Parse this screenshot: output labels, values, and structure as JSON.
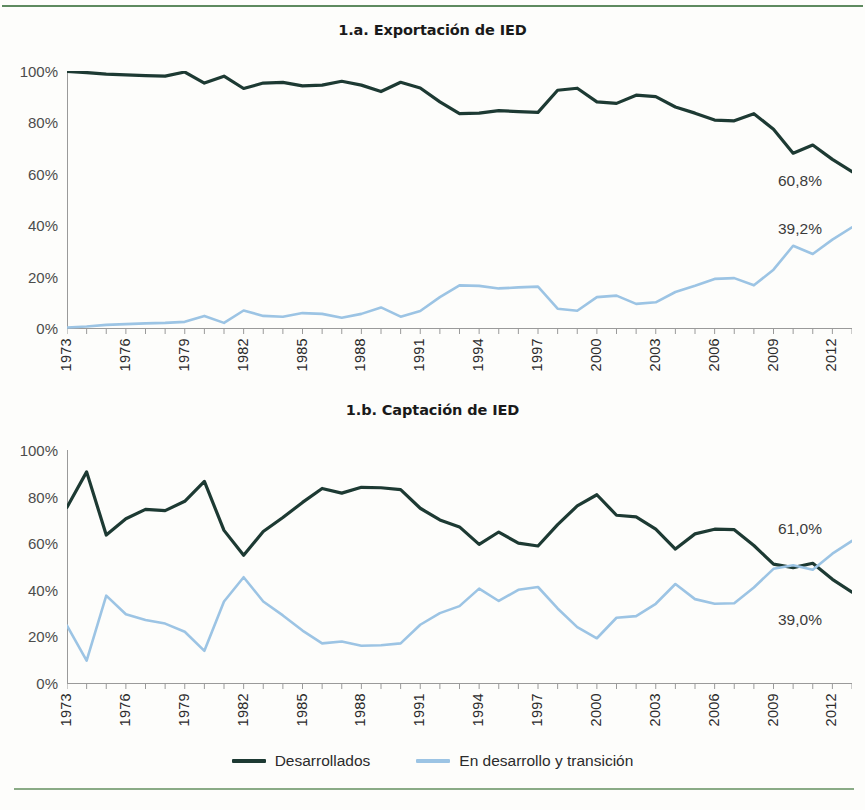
{
  "colors": {
    "developed": "#1d3a33",
    "developing": "#9cc4e4",
    "axis": "#9a9a9a",
    "rule_top": "#5e8a5f",
    "rule_bottom": "#8aab86",
    "tick_text": "#2b2b2b"
  },
  "legend": {
    "items": [
      {
        "label": "Desarrollados",
        "color": "#1d3a33"
      },
      {
        "label": "En desarrollo y transición",
        "color": "#9cc4e4"
      }
    ]
  },
  "charts": [
    {
      "id": "exportacion",
      "title": "1.a. Exportación de IED",
      "ytick_labels": [
        "100%",
        "80%",
        "60%",
        "40%",
        "20%",
        "0%"
      ],
      "xtick_labels": [
        "1973",
        "1976",
        "1979",
        "1982",
        "1985",
        "1988",
        "1991",
        "1994",
        "1997",
        "2000",
        "2003",
        "2006",
        "2009",
        "2012"
      ],
      "end_labels": [
        {
          "text": "60,8%",
          "series": "Desarrollados"
        },
        {
          "text": "39,2%",
          "series": "En desarrollo y transición"
        }
      ]
    },
    {
      "id": "captacion",
      "title": "1.b. Captación de IED",
      "ytick_labels": [
        "100%",
        "80%",
        "60%",
        "40%",
        "20%",
        "0%"
      ],
      "xtick_labels": [
        "1973",
        "1976",
        "1979",
        "1982",
        "1985",
        "1988",
        "1991",
        "1994",
        "1997",
        "2000",
        "2003",
        "2006",
        "2009",
        "2012"
      ],
      "end_labels": [
        {
          "text": "61,0%",
          "series": "En desarrollo y transición"
        },
        {
          "text": "39,0%",
          "series": "Desarrollados"
        }
      ]
    }
  ],
  "chart_data": [
    {
      "type": "line",
      "title": "1.a. Exportación de IED",
      "xlabel": "",
      "ylabel": "",
      "ylim": [
        0,
        100
      ],
      "yticks": [
        0,
        20,
        40,
        60,
        80,
        100
      ],
      "ytick_labels": [
        "0%",
        "20%",
        "40%",
        "60%",
        "80%",
        "100%"
      ],
      "grid": false,
      "legend_position": "bottom",
      "x": [
        1973,
        1974,
        1975,
        1976,
        1977,
        1978,
        1979,
        1980,
        1981,
        1982,
        1983,
        1984,
        1985,
        1986,
        1987,
        1988,
        1989,
        1990,
        1991,
        1992,
        1993,
        1994,
        1995,
        1996,
        1997,
        1998,
        1999,
        2000,
        2001,
        2002,
        2003,
        2004,
        2005,
        2006,
        2007,
        2008,
        2009,
        2010,
        2011,
        2012,
        2013
      ],
      "series": [
        {
          "name": "Desarrollados",
          "color": "#1d3a33",
          "values": [
            99.8,
            99.4,
            98.8,
            98.5,
            98.2,
            98.0,
            99.6,
            95.3,
            98.0,
            93.2,
            95.3,
            95.6,
            94.2,
            94.5,
            96.0,
            94.5,
            92.0,
            95.6,
            93.4,
            88.0,
            83.4,
            83.6,
            84.6,
            84.2,
            83.9,
            92.5,
            93.3,
            88.0,
            87.4,
            90.6,
            90.0,
            86.0,
            83.6,
            80.9,
            80.6,
            83.4,
            77.3,
            68.0,
            71.2,
            65.6,
            60.8
          ]
        },
        {
          "name": "En desarrollo y transición",
          "color": "#9cc4e4",
          "values": [
            0.2,
            0.6,
            1.2,
            1.5,
            1.8,
            2.0,
            2.4,
            4.7,
            2.0,
            6.8,
            4.7,
            4.4,
            5.8,
            5.5,
            4.0,
            5.5,
            8.0,
            4.4,
            6.6,
            12.0,
            16.6,
            16.4,
            15.4,
            15.8,
            16.1,
            7.5,
            6.7,
            12.0,
            12.6,
            9.4,
            10.0,
            14.0,
            16.4,
            19.1,
            19.4,
            16.6,
            22.7,
            32.0,
            28.8,
            34.4,
            39.2
          ]
        }
      ],
      "annotations": [
        {
          "text": "60,8%",
          "x": 2013,
          "y": 60.8,
          "series": "Desarrollados"
        },
        {
          "text": "39,2%",
          "x": 2013,
          "y": 39.2,
          "series": "En desarrollo y transición"
        }
      ]
    },
    {
      "type": "line",
      "title": "1.b. Captación de IED",
      "xlabel": "",
      "ylabel": "",
      "ylim": [
        0,
        100
      ],
      "yticks": [
        0,
        20,
        40,
        60,
        80,
        100
      ],
      "ytick_labels": [
        "0%",
        "20%",
        "40%",
        "60%",
        "80%",
        "100%"
      ],
      "grid": false,
      "legend_position": "bottom",
      "x": [
        1973,
        1974,
        1975,
        1976,
        1977,
        1978,
        1979,
        1980,
        1981,
        1982,
        1983,
        1984,
        1985,
        1986,
        1987,
        1988,
        1989,
        1990,
        1991,
        1992,
        1993,
        1994,
        1995,
        1996,
        1997,
        1998,
        1999,
        2000,
        2001,
        2002,
        2003,
        2004,
        2005,
        2006,
        2007,
        2008,
        2009,
        2010,
        2011,
        2012,
        2013
      ],
      "series": [
        {
          "name": "Desarrollados",
          "color": "#1d3a33",
          "values": [
            75.4,
            90.6,
            63.5,
            70.5,
            74.5,
            74.0,
            78.0,
            86.5,
            65.5,
            54.8,
            65.0,
            71.0,
            77.5,
            83.5,
            81.5,
            84.0,
            83.8,
            83.0,
            75.0,
            70.0,
            67.0,
            59.5,
            64.8,
            60.0,
            58.8,
            68.0,
            76.0,
            80.8,
            72.0,
            71.3,
            66.0,
            57.5,
            64.0,
            66.0,
            65.8,
            59.0,
            51.0,
            49.5,
            51.4,
            44.5,
            39.0
          ]
        },
        {
          "name": "En desarrollo y transición",
          "color": "#9cc4e4",
          "values": [
            24.6,
            9.6,
            37.5,
            29.5,
            27.0,
            25.5,
            22.0,
            13.8,
            35.0,
            45.4,
            35.0,
            29.0,
            22.5,
            17.0,
            17.8,
            16.0,
            16.2,
            17.0,
            25.0,
            30.0,
            33.0,
            40.5,
            35.2,
            40.0,
            41.2,
            32.0,
            24.0,
            19.2,
            28.0,
            28.7,
            34.0,
            42.5,
            36.0,
            34.0,
            34.2,
            41.0,
            49.0,
            50.5,
            48.6,
            55.5,
            61.0
          ]
        }
      ],
      "annotations": [
        {
          "text": "61,0%",
          "x": 2013,
          "y": 61.0,
          "series": "En desarrollo y transición"
        },
        {
          "text": "39,0%",
          "x": 2013,
          "y": 39.0,
          "series": "Desarrollados"
        }
      ]
    }
  ]
}
